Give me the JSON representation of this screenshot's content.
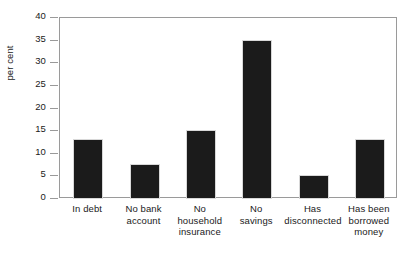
{
  "chart_data": {
    "type": "bar",
    "title": "",
    "xlabel": "",
    "ylabel": "per cent",
    "categories": [
      "In debt",
      "No bank account",
      "No household insurance",
      "No savings",
      "Has disconnected",
      "Has been borrowed money"
    ],
    "category_lines": [
      [
        "In debt"
      ],
      [
        "No bank",
        "account"
      ],
      [
        "No",
        "household",
        "insurance"
      ],
      [
        "No",
        "savings"
      ],
      [
        "Has",
        "disconnected"
      ],
      [
        "Has been",
        "borrowed",
        "money"
      ]
    ],
    "values": [
      13,
      7.5,
      15,
      35,
      5,
      13
    ],
    "ylim": [
      0,
      40
    ],
    "ytick_labels": [
      "0",
      "5",
      "10",
      "15",
      "20",
      "25",
      "30",
      "35",
      "40"
    ],
    "ytick_values": [
      0,
      5,
      10,
      15,
      20,
      25,
      30,
      35,
      40
    ],
    "grid": false,
    "legend": "none",
    "bar_color": "#1b1b1b",
    "axis_color": "#9a9a9a"
  }
}
